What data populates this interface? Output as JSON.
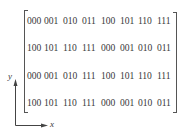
{
  "matrix": {
    "rows": [
      [
        "000",
        "001",
        "010",
        "011",
        "100",
        "101",
        "110",
        "111"
      ],
      [
        "100",
        "101",
        "110",
        "111",
        "000",
        "001",
        "010",
        "011"
      ],
      [
        "000",
        "001",
        "010",
        "111",
        "100",
        "101",
        "110",
        "111"
      ],
      [
        "100",
        "101",
        "110",
        "111",
        "000",
        "001",
        "010",
        "011"
      ]
    ]
  },
  "axes": {
    "y_label": "y",
    "x_label": "x"
  }
}
